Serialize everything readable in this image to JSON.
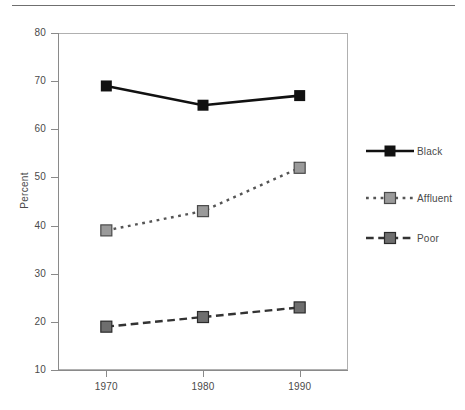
{
  "figure": {
    "top_rule": true,
    "background": "#ffffff"
  },
  "chart_data": {
    "type": "line",
    "title": "",
    "subtitle": "",
    "xlabel": "",
    "ylabel": "Percent",
    "categories": [
      "1970",
      "1980",
      "1990"
    ],
    "x": [
      1970,
      1980,
      1990
    ],
    "xlim": [
      1965,
      1995
    ],
    "ylim": [
      10,
      80
    ],
    "yticks": [
      10,
      20,
      30,
      40,
      50,
      60,
      70,
      80
    ],
    "ytick_labels": [
      "10",
      "20",
      "30",
      "40",
      "50",
      "60",
      "70",
      "80"
    ],
    "xticks": [
      1970,
      1980,
      1990
    ],
    "xtick_labels": [
      "1970",
      "1980",
      "1990"
    ],
    "grid": false,
    "legend_position": "right",
    "series": [
      {
        "name": "Black",
        "values": [
          69,
          65,
          67
        ],
        "color": "#111111",
        "marker_fill": "#111111",
        "marker_edge": "#111111",
        "line_style": "solid",
        "line_width": 2.6,
        "marker": "square"
      },
      {
        "name": "Affluent",
        "values": [
          39,
          43,
          52
        ],
        "color": "#555555",
        "marker_fill": "#9a9a9a",
        "marker_edge": "#4a4a4a",
        "line_style": "dotted",
        "line_width": 2.4,
        "marker": "square"
      },
      {
        "name": "Poor",
        "values": [
          19,
          21,
          23
        ],
        "color": "#333333",
        "marker_fill": "#6e6e6e",
        "marker_edge": "#2b2b2b",
        "line_style": "dashed",
        "line_width": 2.4,
        "marker": "square"
      }
    ]
  },
  "legend": {
    "items": [
      {
        "label": "Black"
      },
      {
        "label": "Affluent"
      },
      {
        "label": "Poor"
      }
    ]
  },
  "axes": {
    "y_title": "Percent",
    "y_tick_labels": [
      "80",
      "70",
      "60",
      "50",
      "40",
      "30",
      "20",
      "10"
    ],
    "x_tick_labels": [
      "1970",
      "1980",
      "1990"
    ]
  },
  "colors": {
    "frame": "#b0b0b0",
    "axis": "#8a8a8a",
    "text": "#4a4a4a",
    "rule": "#6f6f6f",
    "black_series": "#111111",
    "affluent_series": "#9a9a9a",
    "poor_series": "#6e6e6e"
  }
}
